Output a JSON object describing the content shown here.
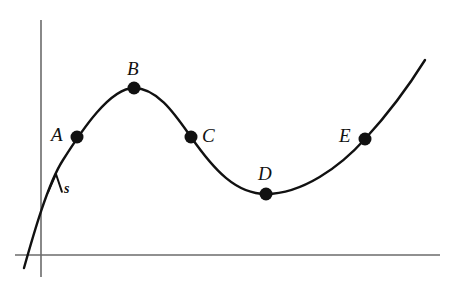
{
  "figure": {
    "kind": "math-curve-diagram",
    "background_color": "#ffffff",
    "curve_color": "#111111",
    "axis_color": "#6b6b6b",
    "point_color": "#111111",
    "axes": {
      "y_axis": {
        "x": 41,
        "y_top": 20,
        "y_bottom": 277
      },
      "x_axis": {
        "y": 255,
        "x_left": 15,
        "x_right": 440
      },
      "ticks": "none",
      "grid": "off",
      "x_tick_labels": [],
      "y_tick_labels": []
    },
    "direction_marker": {
      "label": "s",
      "label_x": 64,
      "label_y": 182,
      "arrow_on_curve_x": 55,
      "arrow_on_curve_y": 181,
      "arrow_points": "up-right along curve"
    },
    "points": [
      {
        "id": "A",
        "label": "A",
        "x": 77,
        "y": 137,
        "label_x": 51,
        "label_y": 125,
        "role": "on-rising-branch"
      },
      {
        "id": "B",
        "label": "B",
        "x": 134,
        "y": 88,
        "label_x": 127,
        "label_y": 59,
        "role": "local-maximum"
      },
      {
        "id": "C",
        "label": "C",
        "x": 191,
        "y": 137,
        "label_x": 202,
        "label_y": 126,
        "role": "on-falling-branch"
      },
      {
        "id": "D",
        "label": "D",
        "x": 266,
        "y": 194,
        "label_x": 258,
        "label_y": 164,
        "role": "local-minimum"
      },
      {
        "id": "E",
        "label": "E",
        "x": 365,
        "y": 139,
        "label_x": 339,
        "label_y": 126,
        "role": "on-rising-branch"
      }
    ],
    "curve_path": "M 24,268 C 33,236 48,183 63,160 C 82,130 110,88 134,88 C 158,88 176,116 191,137 C 214,170 236,194 266,194 C 302,194 340,167 365,139 C 388,114 410,84 425,60",
    "point_radius": 6.5
  },
  "chart_data": {
    "type": "line",
    "title": "",
    "xlabel": "",
    "ylabel": "",
    "grid": "off",
    "legend": "none",
    "xlim": [
      0,
      452
    ],
    "ylim": [
      0,
      299
    ],
    "annotations": [
      "A",
      "B",
      "C",
      "D",
      "E",
      "s"
    ],
    "series": [
      {
        "name": "curve",
        "x": [
          24,
          63,
          77,
          134,
          191,
          266,
          365,
          425
        ],
        "y": [
          268,
          160,
          137,
          88,
          137,
          194,
          139,
          60
        ]
      }
    ],
    "marked_points": {
      "labels": [
        "A",
        "B",
        "C",
        "D",
        "E"
      ],
      "x": [
        77,
        134,
        191,
        266,
        365
      ],
      "y": [
        137,
        88,
        137,
        194,
        139
      ]
    }
  }
}
